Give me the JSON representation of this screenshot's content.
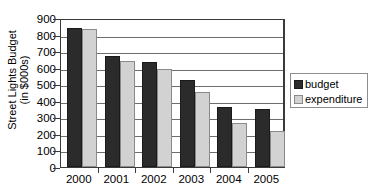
{
  "chart_data": {
    "type": "bar",
    "title": "",
    "xlabel": "",
    "ylabel": "Street Lights Budget (in $000s)",
    "ylabel_lines": [
      "Street Lights Budget",
      "(in $000s)"
    ],
    "categories": [
      "2000",
      "2001",
      "2002",
      "2003",
      "2004",
      "2005"
    ],
    "series": [
      {
        "name": "budget",
        "color": "#2b2b2b",
        "values": [
          840,
          670,
          635,
          525,
          360,
          350
        ]
      },
      {
        "name": "expenditure",
        "color": "#d2d2d2",
        "values": [
          835,
          640,
          590,
          455,
          265,
          215
        ]
      }
    ],
    "ylim": [
      0,
      900
    ],
    "ytick_labels": [
      "900",
      "800",
      "700",
      "600",
      "500",
      "400",
      "300",
      "200",
      "100",
      "0"
    ],
    "ytick_values": [
      900,
      800,
      700,
      600,
      500,
      400,
      300,
      200,
      100,
      0
    ],
    "grid": true,
    "legend_position": "right",
    "legend_entries": [
      "budget",
      "expenditure"
    ]
  }
}
